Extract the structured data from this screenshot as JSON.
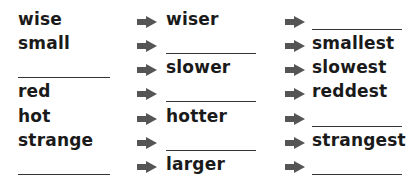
{
  "exercise": {
    "rows": [
      {
        "base": "wise",
        "comparative": "wiser",
        "superlative": ""
      },
      {
        "base": "small",
        "comparative": "",
        "superlative": "smallest"
      },
      {
        "base": "",
        "comparative": "slower",
        "superlative": "slowest"
      },
      {
        "base": "red",
        "comparative": "",
        "superlative": "reddest"
      },
      {
        "base": "hot",
        "comparative": "hotter",
        "superlative": ""
      },
      {
        "base": "strange",
        "comparative": "",
        "superlative": "strangest"
      },
      {
        "base": "",
        "comparative": "larger",
        "superlative": ""
      }
    ],
    "arrow_icon": "right-arrow-icon",
    "arrow_color": "#555555"
  }
}
